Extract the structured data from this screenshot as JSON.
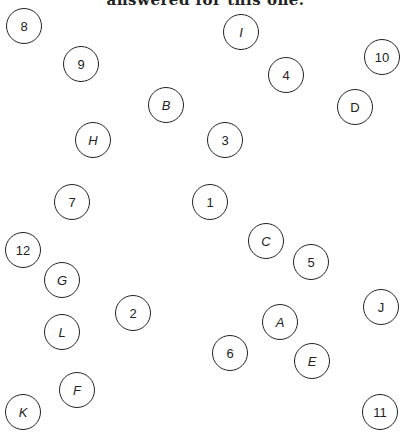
{
  "caption": "answered for this one.",
  "colors": {
    "stroke": "#222222",
    "background": "#ffffff"
  },
  "nodes": [
    {
      "label": "8",
      "x": 24,
      "y": 26,
      "italic": false
    },
    {
      "label": "9",
      "x": 81,
      "y": 64,
      "italic": false
    },
    {
      "label": "I",
      "x": 241,
      "y": 32,
      "italic": true
    },
    {
      "label": "4",
      "x": 286,
      "y": 75,
      "italic": false
    },
    {
      "label": "10",
      "x": 382,
      "y": 57,
      "italic": false
    },
    {
      "label": "D",
      "x": 355,
      "y": 107,
      "italic": false
    },
    {
      "label": "B",
      "x": 166,
      "y": 105,
      "italic": true
    },
    {
      "label": "H",
      "x": 93,
      "y": 140,
      "italic": true
    },
    {
      "label": "3",
      "x": 225,
      "y": 140,
      "italic": false
    },
    {
      "label": "7",
      "x": 72,
      "y": 202,
      "italic": false
    },
    {
      "label": "1",
      "x": 210,
      "y": 202,
      "italic": false
    },
    {
      "label": "C",
      "x": 266,
      "y": 241,
      "italic": true
    },
    {
      "label": "12",
      "x": 23,
      "y": 250,
      "italic": false
    },
    {
      "label": "5",
      "x": 311,
      "y": 262,
      "italic": false
    },
    {
      "label": "G",
      "x": 62,
      "y": 280,
      "italic": true
    },
    {
      "label": "2",
      "x": 133,
      "y": 313,
      "italic": false
    },
    {
      "label": "J",
      "x": 381,
      "y": 307,
      "italic": false
    },
    {
      "label": "A",
      "x": 280,
      "y": 322,
      "italic": true
    },
    {
      "label": "L",
      "x": 62,
      "y": 332,
      "italic": true
    },
    {
      "label": "6",
      "x": 230,
      "y": 353,
      "italic": false
    },
    {
      "label": "E",
      "x": 312,
      "y": 361,
      "italic": true
    },
    {
      "label": "F",
      "x": 77,
      "y": 390,
      "italic": true
    },
    {
      "label": "K",
      "x": 23,
      "y": 412,
      "italic": true
    },
    {
      "label": "11",
      "x": 380,
      "y": 412,
      "italic": false
    }
  ]
}
